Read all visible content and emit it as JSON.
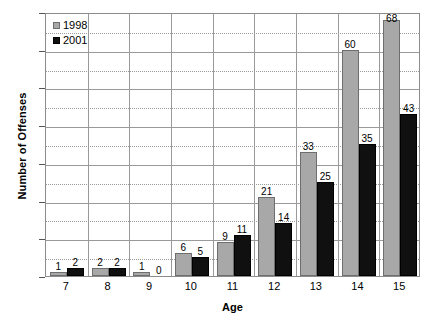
{
  "chart_data": {
    "type": "bar",
    "title": "",
    "xlabel": "Age",
    "ylabel": "Number of Offenses",
    "categories": [
      "7",
      "8",
      "9",
      "10",
      "11",
      "12",
      "13",
      "14",
      "15"
    ],
    "series": [
      {
        "name": "1998",
        "color": "#a8a8a8",
        "values": [
          1,
          2,
          1,
          6,
          9,
          21,
          33,
          60,
          68
        ]
      },
      {
        "name": "2001",
        "color": "#101010",
        "values": [
          2,
          2,
          0,
          5,
          11,
          14,
          25,
          35,
          43
        ]
      }
    ],
    "ylim": [
      0,
      70
    ],
    "ytick_major": [
      0,
      10,
      20,
      30,
      40,
      50,
      60,
      70
    ],
    "ytick_minor": [
      5,
      15,
      25,
      35,
      45,
      55,
      65
    ],
    "ytick_labels": [
      "0",
      "10",
      "20",
      "30",
      "40",
      "50",
      "60",
      "70"
    ],
    "grid": true,
    "grid_major_style": "solid",
    "grid_minor_style": "dotted",
    "vertical_category_gridlines": true,
    "data_labels": true,
    "legend_position": "top-left-inside"
  },
  "legend": {
    "entries": [
      {
        "label": "1998",
        "swatch": "gray-square-swatch"
      },
      {
        "label": "2001",
        "swatch": "black-square-swatch"
      }
    ]
  }
}
